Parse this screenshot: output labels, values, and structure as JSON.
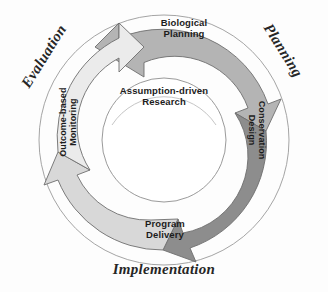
{
  "diagram": {
    "type": "cyclical-arrow-diagram",
    "colors": {
      "arrow_dark": "#8d8d8d",
      "arrow_medium": "#b4b4b4",
      "arrow_light": "#d8d8d8",
      "arrow_lightest": "#ebebeb",
      "outline": "#6e6e6e",
      "hub": "#ffffff",
      "background": "#fdfdfd",
      "text": "#1a1a1a"
    },
    "center": {
      "label_line1": "Assumption-driven",
      "label_line2": "Research"
    },
    "steps": [
      {
        "id": "biological-planning",
        "label_line1": "Biological",
        "label_line2": "Planning",
        "position": "top",
        "orientation": "horizontal",
        "arrow_color": "#b4b4b4"
      },
      {
        "id": "conservation-design",
        "label_line1": "Conservation",
        "label_line2": "Design",
        "position": "right",
        "orientation": "rotated-90",
        "arrow_color": "#8d8d8d"
      },
      {
        "id": "program-delivery",
        "label_line1": "Program",
        "label_line2": "Delivery",
        "position": "bottom",
        "orientation": "horizontal",
        "arrow_color": "#d8d8d8"
      },
      {
        "id": "outcome-based-monitoring",
        "label_line1": "Outcome-based",
        "label_line2": "Monitoring",
        "position": "left",
        "orientation": "rotated-270",
        "arrow_color": "#ebebeb"
      }
    ],
    "phases": [
      {
        "id": "evaluation",
        "label": "Evaluation",
        "position": "upper-left"
      },
      {
        "id": "planning",
        "label": "Planning",
        "position": "upper-right"
      },
      {
        "id": "implementation",
        "label": "Implementation",
        "position": "bottom"
      }
    ]
  }
}
